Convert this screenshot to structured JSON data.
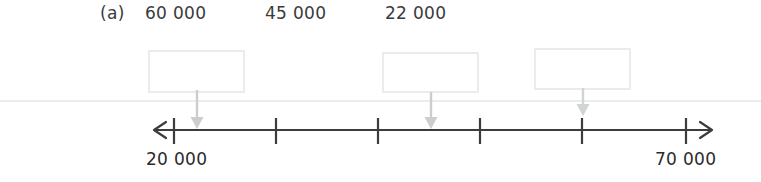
{
  "worksheet": {
    "part_marker": "(a)",
    "width": 761,
    "height": 182,
    "colors": {
      "text": "#2b2b2d",
      "axis": "#3c3c3e",
      "arrow": "#c9cacc",
      "box_border": "#ebebed",
      "page_rule": "#e3e5e8"
    }
  },
  "top_numbers": [
    {
      "value": "60 000",
      "x": 145
    },
    {
      "value": "45 000",
      "x": 265
    },
    {
      "value": "22 000",
      "x": 385
    }
  ],
  "answer_boxes": [
    {
      "name": "answer-box-1",
      "value": "",
      "x": 148,
      "y": 50,
      "w": 97,
      "h": 43
    },
    {
      "name": "answer-box-2",
      "value": "",
      "x": 382,
      "y": 52,
      "w": 97,
      "h": 41
    },
    {
      "name": "answer-box-3",
      "value": "",
      "x": 534,
      "y": 48,
      "w": 97,
      "h": 42
    }
  ],
  "pointer_arrows": [
    {
      "name": "pointer-arrow-1",
      "x": 196,
      "y_top": 92,
      "y_bottom": 128
    },
    {
      "name": "pointer-arrow-2",
      "x": 430,
      "y_top": 94,
      "y_bottom": 128
    },
    {
      "name": "pointer-arrow-3",
      "x": 582,
      "y_top": 90,
      "y_bottom": 116
    }
  ],
  "number_line": {
    "start_label": "20 000",
    "end_label": "70 000",
    "start_value": 20000,
    "end_value": 70000,
    "interval": 10000,
    "axis_y": 130,
    "left_arrow_x": 154,
    "right_arrow_x": 712,
    "tick_positions": [
      174,
      276,
      378,
      480,
      582,
      686
    ],
    "tick_values": [
      "20 000",
      "30 000",
      "40 000",
      "50 000",
      "60 000",
      "70 000"
    ],
    "labelled_ticks": [
      {
        "label": "20 000",
        "x": 146,
        "y": 148
      },
      {
        "label": "70 000",
        "x": 655,
        "y": 148
      }
    ]
  }
}
